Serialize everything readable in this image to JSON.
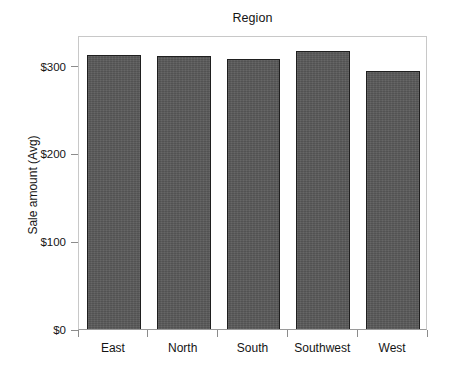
{
  "chart_data": {
    "type": "bar",
    "title": "Region",
    "xlabel": "",
    "ylabel": "Sale amount (Avg)",
    "categories": [
      "East",
      "North",
      "South",
      "Southwest",
      "West"
    ],
    "values": [
      312,
      311,
      308,
      317,
      294
    ],
    "ylim": [
      0,
      335
    ],
    "ytick_values": [
      0,
      100,
      200,
      300
    ],
    "ytick_labels": [
      "$0",
      "$100",
      "$200",
      "$300"
    ],
    "grid": false,
    "legend": false,
    "bar_color": "#5a5a5a",
    "bar_edge_color": "#1f1f1f",
    "frame_color": "#c8c8c8",
    "background_color": "#ffffff"
  }
}
